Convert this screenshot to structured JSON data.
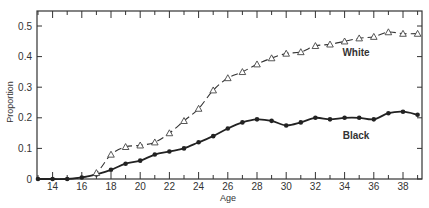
{
  "chart_data": {
    "type": "line",
    "title": "",
    "xlabel": "Age",
    "ylabel": "Proportion",
    "xlim": [
      13,
      39
    ],
    "ylim": [
      0,
      0.55
    ],
    "x_ticks": [
      14,
      16,
      18,
      20,
      22,
      24,
      26,
      28,
      30,
      32,
      34,
      36,
      38
    ],
    "y_ticks": [
      0,
      0.1,
      0.2,
      0.3,
      0.4,
      0.5
    ],
    "y_tick_labels": [
      "0",
      "0.1",
      "0.2",
      "0.3",
      "0.4",
      "0.5"
    ],
    "grid": false,
    "legend": "inline labels",
    "x": [
      13,
      14,
      15,
      16,
      17,
      18,
      19,
      20,
      21,
      22,
      23,
      24,
      25,
      26,
      27,
      28,
      29,
      30,
      31,
      32,
      33,
      34,
      35,
      36,
      37,
      38,
      39
    ],
    "series": [
      {
        "name": "White",
        "marker": "open-triangle",
        "line": "dashed smooth",
        "label_pos": {
          "age": 35.5,
          "value": 0.41
        },
        "values": [
          0,
          0,
          0,
          0.005,
          0.02,
          0.08,
          0.105,
          0.11,
          0.12,
          0.15,
          0.19,
          0.23,
          0.29,
          0.33,
          0.35,
          0.375,
          0.395,
          0.41,
          0.415,
          0.435,
          0.44,
          0.45,
          0.46,
          0.465,
          0.48,
          0.475,
          0.475
        ]
      },
      {
        "name": "Black",
        "marker": "filled-circle",
        "line": "solid smooth",
        "label_pos": {
          "age": 35.5,
          "value": 0.15
        },
        "values": [
          0,
          0,
          0,
          0.005,
          0.015,
          0.03,
          0.05,
          0.06,
          0.08,
          0.09,
          0.1,
          0.12,
          0.14,
          0.165,
          0.185,
          0.195,
          0.19,
          0.175,
          0.185,
          0.2,
          0.195,
          0.2,
          0.2,
          0.195,
          0.215,
          0.22,
          0.21
        ]
      }
    ]
  },
  "labels": {
    "xlabel": "Age",
    "ylabel": "Proportion",
    "white": "White",
    "black": "Black"
  }
}
